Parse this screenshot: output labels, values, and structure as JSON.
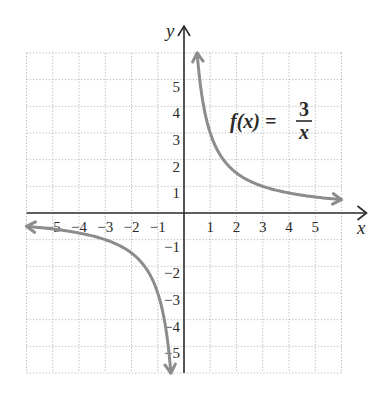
{
  "chart_data": {
    "type": "line",
    "title": "",
    "xlabel": "x",
    "ylabel": "y",
    "xlim": [
      -6,
      6
    ],
    "ylim": [
      -6,
      6
    ],
    "grid": true,
    "grid_style": "dotted",
    "x_ticks": [
      -5,
      -4,
      -3,
      -2,
      -1,
      1,
      2,
      3,
      4,
      5
    ],
    "y_ticks": [
      -5,
      -4,
      -3,
      -2,
      -1,
      1,
      2,
      3,
      4,
      5
    ],
    "x_tick_labels": [
      "−5",
      "−4",
      "−3",
      "−2",
      "−1",
      "1",
      "2",
      "3",
      "4",
      "5"
    ],
    "y_tick_labels": [
      "−5",
      "−4",
      "−3",
      "−2",
      "−1",
      "1",
      "2",
      "3",
      "4",
      "5"
    ],
    "series": [
      {
        "name": "f(x) = 3/x, x > 0",
        "function": "3/x",
        "x_range": [
          0.5,
          6
        ],
        "points": [
          [
            0.5,
            6
          ],
          [
            0.75,
            4
          ],
          [
            1,
            3
          ],
          [
            1.5,
            2
          ],
          [
            2,
            1.5
          ],
          [
            3,
            1
          ],
          [
            4,
            0.75
          ],
          [
            5,
            0.6
          ],
          [
            6,
            0.5
          ]
        ],
        "color": "#8c8c8c",
        "arrows": "both"
      },
      {
        "name": "f(x) = 3/x, x < 0",
        "function": "3/x",
        "x_range": [
          -6,
          -0.5
        ],
        "points": [
          [
            -6,
            -0.5
          ],
          [
            -5,
            -0.6
          ],
          [
            -4,
            -0.75
          ],
          [
            -3,
            -1
          ],
          [
            -2,
            -1.5
          ],
          [
            -1.5,
            -2
          ],
          [
            -1,
            -3
          ],
          [
            -0.75,
            -4
          ],
          [
            -0.5,
            -6
          ]
        ],
        "color": "#8c8c8c",
        "arrows": "both"
      }
    ],
    "annotation": {
      "lhs": "f(x) =",
      "numerator": "3",
      "denominator": "x"
    },
    "colors": {
      "axis": "#2a2a2a",
      "grid": "#b5b5b5",
      "curve": "#8c8c8c"
    }
  }
}
